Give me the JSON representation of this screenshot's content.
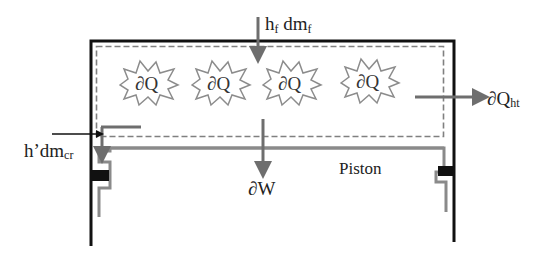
{
  "diagram": {
    "type": "engine-cylinder-control-volume",
    "labels": {
      "fuel_inflow_h": "h",
      "fuel_inflow_h_sub": "f",
      "fuel_inflow_dm": " dm",
      "fuel_inflow_dm_sub": "f",
      "crevice_flow_h": "h’dm",
      "crevice_flow_sub": "cr",
      "heat_transfer": "∂Q",
      "heat_transfer_sub": "ht",
      "work": "∂W",
      "piston": "Piston"
    },
    "heat_release_bursts": [
      {
        "label": "∂Q"
      },
      {
        "label": "∂Q"
      },
      {
        "label": "∂Q"
      },
      {
        "label": "∂Q"
      }
    ],
    "colors": {
      "cylinder_wall": "#111111",
      "arrow": "#6e6e6e",
      "piston": "#8a8a8a",
      "control_volume_dash": "#808080",
      "seal": "#111111",
      "burst_stroke": "#8c8c8c",
      "text": "#222222"
    }
  }
}
